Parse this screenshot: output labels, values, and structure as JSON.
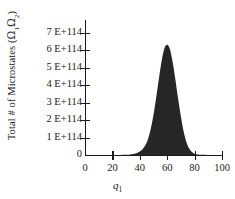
{
  "chart_data": {
    "type": "area",
    "title": "",
    "xlabel": "q₁",
    "ylabel": "Total # of Microstates (Ω₁Ω₂)",
    "xlim": [
      0,
      100
    ],
    "ylim": [
      0,
      7.6
    ],
    "y_scale_note": "values in units of 1E+114",
    "grid": false,
    "legend": null,
    "x_ticks": [
      0,
      20,
      40,
      60,
      80,
      100
    ],
    "x_tick_labels": [
      "0",
      "20",
      "40",
      "60",
      "80",
      "100"
    ],
    "y_ticks": [
      0,
      1,
      2,
      3,
      4,
      5,
      6,
      7
    ],
    "y_tick_labels": [
      "0",
      "1 E+114",
      "2 E+114",
      "3 E+114",
      "4 E+114",
      "5 E+114",
      "6 E+114",
      "7 E+114"
    ],
    "peak_x": 60,
    "peak_y": 6.3,
    "series": [
      {
        "name": "Total # of Microstates",
        "color": "#262626",
        "x": [
          0,
          5,
          10,
          15,
          20,
          25,
          30,
          32,
          34,
          36,
          38,
          40,
          42,
          44,
          46,
          48,
          50,
          52,
          54,
          56,
          58,
          60,
          62,
          64,
          66,
          68,
          70,
          72,
          74,
          76,
          78,
          80,
          82,
          85,
          90,
          95,
          100
        ],
        "values": [
          0,
          0,
          0,
          0,
          0,
          0,
          0.01,
          0.02,
          0.04,
          0.07,
          0.12,
          0.2,
          0.33,
          0.55,
          0.92,
          1.5,
          2.3,
          3.3,
          4.4,
          5.4,
          6.1,
          6.3,
          6.05,
          5.3,
          4.3,
          3.2,
          2.2,
          1.35,
          0.75,
          0.38,
          0.17,
          0.07,
          0.03,
          0.01,
          0,
          0,
          0
        ]
      }
    ]
  },
  "axes": {
    "y_title_prefix": "Total # of Microstates (",
    "y_title_omega1": "Ω",
    "y_title_sub1": "1",
    "y_title_omega2": "Ω",
    "y_title_sub2": "2",
    "y_title_suffix": ")",
    "x_title_var": "q",
    "x_title_sub": "1"
  },
  "colors": {
    "fill": "#262626",
    "axis": "#1a1a1a",
    "background": "#ffffff"
  }
}
